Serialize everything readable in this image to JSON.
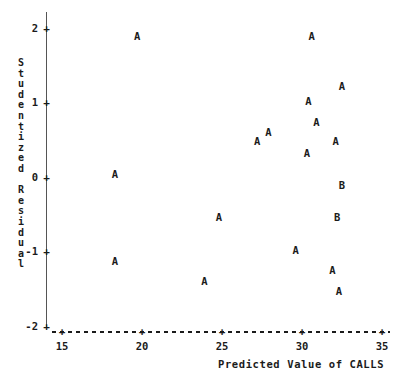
{
  "chart_data": {
    "type": "scatter",
    "title": "",
    "xlabel": "Predicted Value of CALLS",
    "ylabel": "Studentized Residual",
    "xlim": [
      15,
      35
    ],
    "ylim": [
      -2,
      2
    ],
    "xticks": [
      15,
      20,
      25,
      30,
      35
    ],
    "yticks": [
      2,
      1,
      0,
      -1,
      -2
    ],
    "xtick_labels": [
      "15",
      "20",
      "25",
      "30",
      "35"
    ],
    "ytick_labels": [
      "2",
      "1",
      "0",
      "-1",
      "-2"
    ],
    "grid": false,
    "legend": "none",
    "tick_marker": "+",
    "x_axis_style": "dashed",
    "y_axis_style": "solid",
    "point_labels_meaning": "A = 1 observation, B = 2 observations",
    "points": [
      {
        "label": "A",
        "x": 19.7,
        "y": 1.88
      },
      {
        "label": "A",
        "x": 30.6,
        "y": 1.89
      },
      {
        "label": "A",
        "x": 32.5,
        "y": 1.22
      },
      {
        "label": "A",
        "x": 30.4,
        "y": 1.02
      },
      {
        "label": "A",
        "x": 30.9,
        "y": 0.73
      },
      {
        "label": "A",
        "x": 27.9,
        "y": 0.6
      },
      {
        "label": "A",
        "x": 27.2,
        "y": 0.47
      },
      {
        "label": "A",
        "x": 32.1,
        "y": 0.47
      },
      {
        "label": "A",
        "x": 30.3,
        "y": 0.32
      },
      {
        "label": "A",
        "x": 18.3,
        "y": 0.03
      },
      {
        "label": "B",
        "x": 32.5,
        "y": -0.11
      },
      {
        "label": "A",
        "x": 24.8,
        "y": -0.55
      },
      {
        "label": "B",
        "x": 32.2,
        "y": -0.55
      },
      {
        "label": "A",
        "x": 29.6,
        "y": -0.98
      },
      {
        "label": "A",
        "x": 18.3,
        "y": -1.14
      },
      {
        "label": "A",
        "x": 31.9,
        "y": -1.26
      },
      {
        "label": "A",
        "x": 23.9,
        "y": -1.4
      },
      {
        "label": "A",
        "x": 32.3,
        "y": -1.54
      }
    ]
  }
}
